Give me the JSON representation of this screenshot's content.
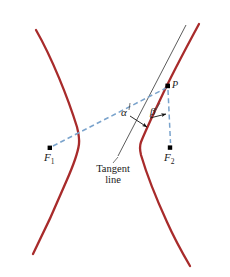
{
  "figure": {
    "type": "geometry-diagram",
    "width": 230,
    "height": 277,
    "background_color": "#ffffff"
  },
  "colors": {
    "curve": "#a82b2b",
    "dashed_line": "#7aa3cc",
    "tangent_line": "#4a4a4a",
    "arrow": "#111111",
    "point": "#000000",
    "text": "#1a1a1a"
  },
  "labels": {
    "focus_1": "F",
    "focus_1_sub": "1",
    "focus_2": "F",
    "focus_2_sub": "2",
    "point_p": "P",
    "alpha": "α",
    "beta": "β",
    "tangent_word_1": "Tangent",
    "tangent_word_2": "line"
  },
  "geometry": {
    "point_p": {
      "x": 168,
      "y": 86
    },
    "focus_1": {
      "x": 50,
      "y": 148
    },
    "focus_2": {
      "x": 170,
      "y": 148
    },
    "left_vertex": {
      "x": 79,
      "y": 140
    },
    "right_vertex": {
      "x": 140,
      "y": 146
    },
    "tangent_line": {
      "x1": 118,
      "y1": 156,
      "x2": 186,
      "y2": 25
    },
    "dashed_f1_to_p": {
      "x1": 53,
      "y1": 146,
      "x2": 166,
      "y2": 88
    },
    "dashed_p_to_f2": {
      "x1": 168,
      "y1": 89,
      "x2": 170,
      "y2": 144
    },
    "alpha_vertex": {
      "x": 151,
      "y": 114
    },
    "beta_vertex": {
      "x": 160,
      "y": 106
    }
  },
  "elements": {
    "left_branch_name": "hyperbola-left-branch",
    "right_branch_name": "hyperbola-right-branch",
    "tangent_name": "tangent-line",
    "f1p_name": "dashed-segment-f1-p",
    "pf2_name": "dashed-segment-p-f2"
  }
}
